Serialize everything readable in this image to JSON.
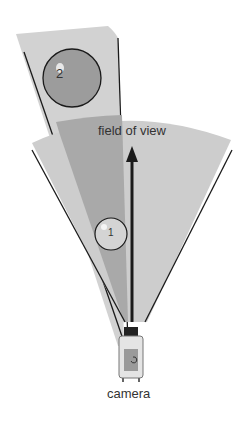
{
  "diagram": {
    "title_label": "field of view",
    "camera_label": "camera",
    "objects": [
      {
        "id": "object-1",
        "label": "1"
      },
      {
        "id": "object-2",
        "label": "2"
      }
    ],
    "colors": {
      "fov_fill": "#cfcfcf",
      "overlap_fill": "#a8a8a8",
      "object_fill": "#9a9a9a",
      "object_light_fill": "#d8d8d8",
      "line": "#1a1a1a"
    }
  }
}
